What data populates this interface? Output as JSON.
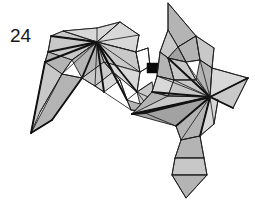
{
  "diagram": {
    "kind": "origami-instruction-step",
    "step_number": "24",
    "background_color": "#ffffff",
    "outline_color": "#1a1a1a",
    "fill_colors": {
      "light": "#c8c8c8",
      "mid": "#b4b4b4",
      "dark": "#a2a2a2",
      "pale": "#d8d8d8",
      "white": "#fdfdfd"
    },
    "arrow": {
      "name": "transform-arrow",
      "direction": "right",
      "color": "#080808",
      "x": 147,
      "y": 57,
      "width": 23,
      "height": 22
    },
    "figures": [
      {
        "id": "before",
        "label": "before-fold-model",
        "position": "left",
        "converge_point": [
          97,
          42
        ]
      },
      {
        "id": "after",
        "label": "after-fold-model",
        "position": "right",
        "converge_point": [
          210,
          97
        ]
      }
    ]
  },
  "canvas": {
    "width": 255,
    "height": 205
  }
}
